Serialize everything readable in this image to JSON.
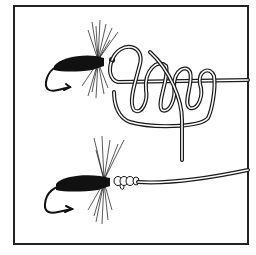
{
  "figure": {
    "type": "illustration",
    "subject": "fishing knot tying a fly to a line",
    "panels": [
      {
        "id": "step-1",
        "description": "fly with line looped into untightened coils"
      },
      {
        "id": "step-2",
        "description": "fly with finished knot snug at the hook eye"
      }
    ],
    "colors": {
      "ink": "#111111",
      "background": "#ffffff",
      "frame": "#222222"
    }
  }
}
